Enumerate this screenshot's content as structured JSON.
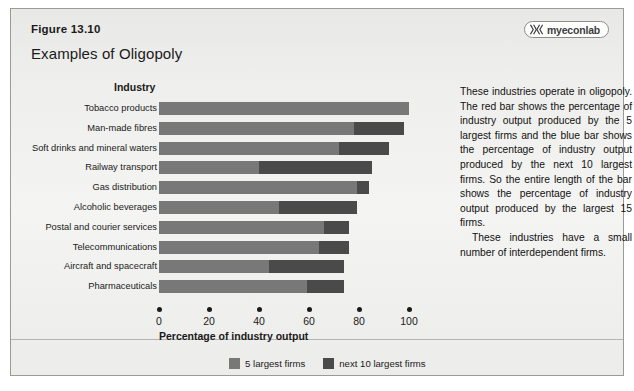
{
  "figure": {
    "number": "Figure 13.10",
    "title": "Examples of Oligopoly"
  },
  "brand": {
    "name": "myeconlab",
    "mark": "double-chevron-icon"
  },
  "chart_data": {
    "type": "bar",
    "orientation": "horizontal",
    "stacked": true,
    "title": "Examples of Oligopoly",
    "xlabel": "Percentage of industry output",
    "ylabel": "Industry",
    "xlim": [
      0,
      100
    ],
    "xticks": [
      0,
      20,
      40,
      60,
      80,
      100
    ],
    "xtick_labels": [
      "0",
      "20",
      "40",
      "60",
      "80",
      "100"
    ],
    "grid": false,
    "legend_position": "bottom-center",
    "categories": [
      "Tobacco products",
      "Man-made fibres",
      "Soft drinks and mineral waters",
      "Railway transport",
      "Gas distribution",
      "Alcoholic beverages",
      "Postal and courier services",
      "Telecommunications",
      "Aircraft and spacecraft",
      "Pharmaceuticals"
    ],
    "series": [
      {
        "name": "5 largest firms",
        "color": "#787878",
        "values": [
          100,
          78,
          72,
          40,
          79,
          48,
          66,
          64,
          44,
          59
        ]
      },
      {
        "name": "next 10 largest firms",
        "color": "#4a4a4a",
        "values": [
          0,
          20,
          20,
          45,
          5,
          31,
          10,
          12,
          30,
          15
        ]
      }
    ],
    "totals": [
      100,
      98,
      92,
      85,
      84,
      79,
      76,
      76,
      74,
      74
    ]
  },
  "legend": [
    {
      "label": "5 largest firms",
      "color": "#787878"
    },
    {
      "label": "next 10 largest firms",
      "color": "#4a4a4a"
    }
  ],
  "sidetext": {
    "paragraph1": "These industries operate in oligopoly. The red bar shows the percentage of industry output produced by the 5 largest firms and the blue bar shows the percentage of industry output produced by the next 10 largest firms. So the entire length of the bar shows the percentage of industry output produced by the largest 15 firms.",
    "paragraph2": "These industries have a small number of interdependent firms."
  }
}
